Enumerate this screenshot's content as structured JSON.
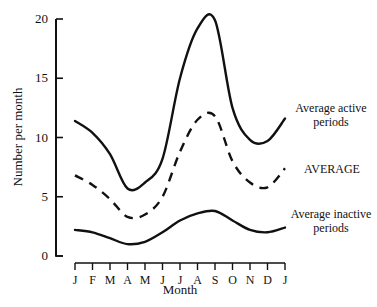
{
  "chart_data": {
    "type": "line",
    "title": "",
    "xlabel": "Month",
    "ylabel": "Number per month",
    "ylim": [
      0,
      20
    ],
    "yticks": [
      0,
      5,
      10,
      15,
      20
    ],
    "grid": false,
    "categories": [
      "J",
      "F",
      "M",
      "A",
      "M",
      "J",
      "J",
      "A",
      "S",
      "O",
      "N",
      "D",
      "J"
    ],
    "series": [
      {
        "name": "Average active periods",
        "style": "solid",
        "values": [
          11.4,
          10.4,
          8.6,
          5.7,
          6.2,
          8.2,
          15.0,
          19.2,
          19.9,
          12.5,
          9.8,
          9.7,
          11.6
        ]
      },
      {
        "name": "AVERAGE",
        "style": "dashed",
        "values": [
          6.8,
          6.0,
          4.8,
          3.3,
          3.5,
          5.0,
          8.8,
          11.5,
          11.8,
          8.0,
          6.2,
          5.8,
          7.4
        ]
      },
      {
        "name": "Average inactive periods",
        "style": "solid",
        "values": [
          2.2,
          2.0,
          1.5,
          1.0,
          1.2,
          2.0,
          3.0,
          3.6,
          3.8,
          3.0,
          2.2,
          2.0,
          2.4
        ]
      }
    ],
    "annotations": [
      {
        "text": "Average active",
        "line2": "periods",
        "series": 0
      },
      {
        "text": "AVERAGE",
        "series": 1
      },
      {
        "text": "Average inactive",
        "line2": "periods",
        "series": 2
      }
    ],
    "legend_position": "inline-right"
  }
}
